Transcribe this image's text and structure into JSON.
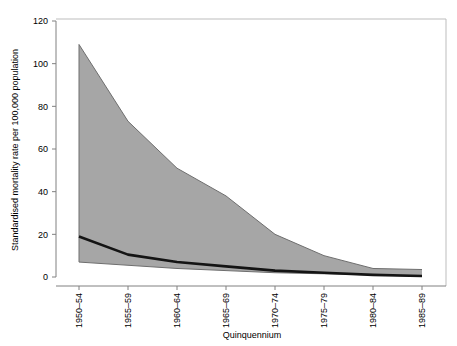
{
  "chart_data": {
    "type": "area",
    "title": "",
    "xlabel": "Quinquennium",
    "ylabel": "Standardised mortality rate per 100,000 population",
    "categories": [
      "1950–54",
      "1955–59",
      "1960–64",
      "1965–69",
      "1970–74",
      "1975–79",
      "1980–84",
      "1985–89"
    ],
    "x_tick_labels": [
      "1950–54",
      "1955–59",
      "1960–64",
      "1965–69",
      "1970–74",
      "1975–79",
      "1980–84",
      "1985–89"
    ],
    "y_tick_labels": [
      "0",
      "20",
      "40",
      "60",
      "80",
      "100",
      "120"
    ],
    "y_ticks": [
      0,
      20,
      40,
      60,
      80,
      100,
      120
    ],
    "ylim": [
      0,
      120
    ],
    "grid": false,
    "legend": "none",
    "series": [
      {
        "name": "Upper bound",
        "role": "band-upper",
        "color": "#9a9a9a",
        "values": [
          109,
          73,
          51,
          38,
          20,
          10,
          4,
          3.5
        ]
      },
      {
        "name": "Lower bound",
        "role": "band-lower",
        "color": "#9a9a9a",
        "values": [
          7,
          5.5,
          4,
          3,
          2,
          1.5,
          1,
          0.3
        ]
      },
      {
        "name": "Median",
        "role": "line",
        "color": "#1a1a1a",
        "values": [
          19,
          10.5,
          7,
          5,
          3,
          2,
          1,
          0.5
        ]
      }
    ],
    "band_fill_color": "#a6a6a6",
    "band_edge_color": "#6e6e6e",
    "median_line_color": "#141414",
    "axis_color": "#808080",
    "frame_color": "#bdbdbd",
    "background_color": "#ffffff"
  }
}
